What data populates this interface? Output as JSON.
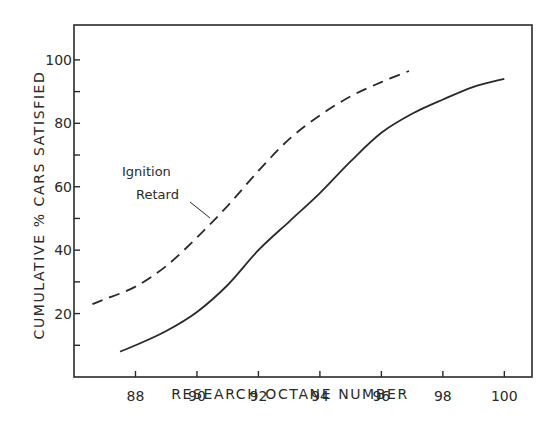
{
  "chart_data": {
    "type": "line",
    "title": "",
    "xlabel": "RESEARCH OCTANE NUMBER",
    "ylabel": "CUMULATIVE % CARS SATISFIED",
    "xlim": [
      86.0,
      100.9
    ],
    "ylim": [
      0,
      111
    ],
    "x_ticks": [
      88,
      90,
      92,
      94,
      96,
      98,
      100
    ],
    "y_ticks_labeled": [
      20,
      40,
      60,
      80,
      100
    ],
    "y_ticks_minor": [
      10,
      30,
      50,
      70,
      90
    ],
    "grid": false,
    "legend": null,
    "annotations": [
      {
        "text_lines": [
          "Ignition",
          "Retard"
        ],
        "points_to": "dashed-series"
      }
    ],
    "series": [
      {
        "name": "Base (solid)",
        "style": "solid",
        "x": [
          87.5,
          88,
          89,
          90,
          91,
          92,
          93,
          94,
          95,
          96,
          97,
          98,
          99,
          100
        ],
        "y": [
          8,
          10,
          14.5,
          20.5,
          29,
          40,
          49,
          58,
          68,
          77,
          83,
          87.5,
          91.5,
          94
        ]
      },
      {
        "name": "Ignition Retard",
        "style": "dashed",
        "x": [
          86.6,
          87,
          88,
          89,
          90,
          91,
          92,
          93,
          94,
          95,
          96,
          96.9
        ],
        "y": [
          23,
          24.5,
          28.5,
          35,
          44,
          54,
          65,
          75,
          82.5,
          88.5,
          93,
          96.5
        ]
      }
    ]
  },
  "labels": {
    "xlabel": "RESEARCH OCTANE NUMBER",
    "ylabel": "CUMULATIVE % CARS SATISFIED",
    "annotation_line1": "Ignition",
    "annotation_line2": "Retard"
  },
  "style": {
    "ink": "#2a2a2a",
    "background": "#ffffff"
  }
}
